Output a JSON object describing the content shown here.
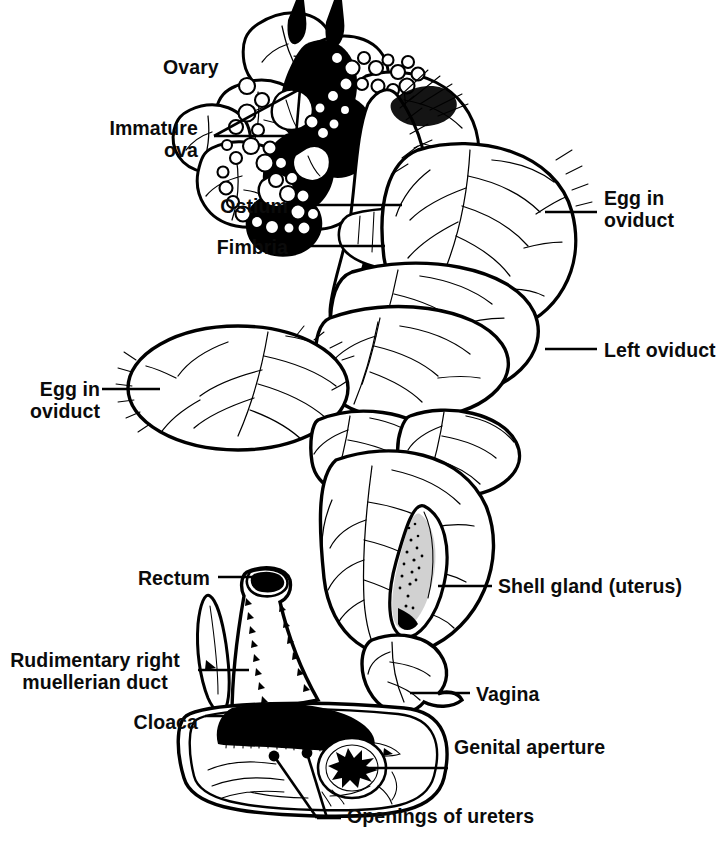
{
  "figure": {
    "type": "anatomical-line-drawing",
    "style": "black-and-white pen-and-ink illustration",
    "background_color": "#ffffff",
    "ink_color": "#000000"
  },
  "labels": [
    {
      "id": "ovary",
      "text": "Ovary",
      "lines": [
        "Ovary"
      ],
      "align": "left",
      "x": 163,
      "y": 57,
      "leader": false
    },
    {
      "id": "immature-ova",
      "text": "Immature ova",
      "lines": [
        "Immature",
        "ova"
      ],
      "align": "right",
      "x": 98,
      "y": 118,
      "leader": true
    },
    {
      "id": "ostium",
      "text": "Ostium",
      "lines": [
        "Ostium"
      ],
      "align": "right",
      "x": 228,
      "y": 196,
      "leader": true
    },
    {
      "id": "fimbria",
      "text": "Fimbria",
      "lines": [
        "Fimbria"
      ],
      "align": "right",
      "x": 205,
      "y": 237,
      "leader": true
    },
    {
      "id": "egg-in-oviduct-right",
      "text": "Egg in oviduct",
      "lines": [
        "Egg in",
        "oviduct"
      ],
      "align": "left",
      "x": 604,
      "y": 188,
      "leader": true
    },
    {
      "id": "left-oviduct",
      "text": "Left oviduct",
      "lines": [
        "Left oviduct"
      ],
      "align": "left",
      "x": 604,
      "y": 340,
      "leader": true
    },
    {
      "id": "egg-in-oviduct-left",
      "text": "Egg in oviduct",
      "lines": [
        "Egg in",
        "oviduct"
      ],
      "align": "right",
      "x": 50,
      "y": 379,
      "leader": true
    },
    {
      "id": "shell-gland",
      "text": "Shell gland (uterus)",
      "lines": [
        "Shell gland (uterus)"
      ],
      "align": "left",
      "x": 498,
      "y": 576,
      "leader": true
    },
    {
      "id": "rectum",
      "text": "Rectum",
      "lines": [
        "Rectum"
      ],
      "align": "right",
      "x": 139,
      "y": 568,
      "leader": true
    },
    {
      "id": "rudimentary-duct",
      "text": "Rudimentary right muellerian duct",
      "lines": [
        "Rudimentary right",
        "muellerian duct"
      ],
      "align": "center",
      "x": 7,
      "y": 650,
      "leader": true
    },
    {
      "id": "cloaca",
      "text": "Cloaca",
      "lines": [
        "Cloaca"
      ],
      "align": "right",
      "x": 150,
      "y": 712,
      "leader": true
    },
    {
      "id": "vagina",
      "text": "Vagina",
      "lines": [
        "Vagina"
      ],
      "align": "left",
      "x": 476,
      "y": 684,
      "leader": true
    },
    {
      "id": "genital-aperture",
      "text": "Genital aperture",
      "lines": [
        "Genital aperture"
      ],
      "align": "left",
      "x": 454,
      "y": 737,
      "leader": true
    },
    {
      "id": "openings-ureters",
      "text": "Openings of ureters",
      "lines": [
        "Openings of ureters"
      ],
      "align": "left",
      "x": 347,
      "y": 806,
      "leader": true
    }
  ],
  "structures": [
    {
      "id": "ovary-cluster",
      "name": "Ovary with follicles"
    },
    {
      "id": "immature-ova-beads",
      "name": "Immature ova"
    },
    {
      "id": "infundibulum",
      "name": "Infundibulum with ostium and fimbria"
    },
    {
      "id": "magnum",
      "name": "Oviduct magnum, egg in oviduct"
    },
    {
      "id": "isthmus",
      "name": "Isthmus"
    },
    {
      "id": "shell-gland-body",
      "name": "Shell gland (uterus)"
    },
    {
      "id": "vagina-body",
      "name": "Vagina"
    },
    {
      "id": "rectum-body",
      "name": "Rectum"
    },
    {
      "id": "cloaca-body",
      "name": "Cloaca"
    },
    {
      "id": "genital-aperture-mark",
      "name": "Genital aperture"
    },
    {
      "id": "ureter-openings",
      "name": "Openings of ureters"
    },
    {
      "id": "rudimentary-duct-body",
      "name": "Rudimentary right muellerian duct"
    }
  ]
}
